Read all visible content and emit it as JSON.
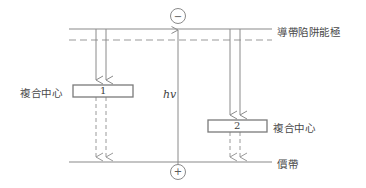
{
  "figure": {
    "type": "band-diagram",
    "width": 366,
    "height": 188,
    "background": "#ffffff",
    "line_color": "#8a8a8a",
    "text_color": "#4a4a4a"
  },
  "labels": {
    "conduction_band_trap": "導帶陷阱能極",
    "valence_band": "價帶",
    "recomb_center_left": "複合中心",
    "recomb_center_right": "複合中心",
    "photon": "hv",
    "box1_number": "1",
    "box2_number": "2",
    "electron_sign": "−",
    "hole_sign": "+"
  },
  "bands": [
    {
      "name": "conduction-band",
      "style": "solid",
      "x1": 69,
      "x2": 272,
      "y": 29
    },
    {
      "name": "trap-level",
      "style": "dashed",
      "x1": 69,
      "x2": 272,
      "y": 40
    },
    {
      "name": "valence-band",
      "style": "solid",
      "x1": 69,
      "x2": 272,
      "y": 162
    }
  ],
  "boxes": [
    {
      "name": "recombination-center-1",
      "x": 73,
      "y": 85,
      "w": 60,
      "h": 12,
      "label": "1"
    },
    {
      "name": "recombination-center-2",
      "x": 208,
      "y": 120,
      "w": 59,
      "h": 12,
      "label": "2"
    }
  ],
  "carriers": [
    {
      "name": "electron",
      "sign": "−",
      "cx": 178,
      "cy": 16,
      "r": 7.5
    },
    {
      "name": "hole",
      "sign": "+",
      "cx": 178,
      "cy": 172,
      "r": 7.5
    }
  ],
  "transitions": [
    {
      "name": "capture-arrow-left-a",
      "style": "solid",
      "x": 96,
      "y1": 29,
      "y2": 85
    },
    {
      "name": "capture-arrow-left-b",
      "style": "solid",
      "x": 106,
      "y1": 29,
      "y2": 85
    },
    {
      "name": "emission-arrow-left-a",
      "style": "dashed",
      "x": 96,
      "y1": 97,
      "y2": 162
    },
    {
      "name": "emission-arrow-left-b",
      "style": "dashed",
      "x": 106,
      "y1": 97,
      "y2": 162
    },
    {
      "name": "capture-arrow-right-a",
      "style": "solid",
      "x": 230,
      "y1": 29,
      "y2": 120
    },
    {
      "name": "capture-arrow-right-b",
      "style": "solid",
      "x": 240,
      "y1": 29,
      "y2": 120
    },
    {
      "name": "emission-arrow-right-a",
      "style": "dashed",
      "x": 230,
      "y1": 132,
      "y2": 162
    },
    {
      "name": "emission-arrow-right-b",
      "style": "dashed",
      "x": 240,
      "y1": 132,
      "y2": 162
    },
    {
      "name": "photon-generation-arrow",
      "style": "solid",
      "x": 178,
      "y1": 166,
      "y2": 25
    }
  ]
}
